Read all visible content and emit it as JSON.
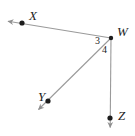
{
  "figure": {
    "type": "geometry-diagram",
    "width": 135,
    "height": 136,
    "background_color": "#ffffff",
    "line_color": "#9a9a9a",
    "point_color": "#1d1d1d",
    "text_color": "#1d1d1d"
  },
  "points": [
    {
      "id": "X",
      "label": "X",
      "x": 22,
      "y": 23
    },
    {
      "id": "W",
      "label": "W",
      "x": 111,
      "y": 38
    },
    {
      "id": "Y",
      "label": "Y",
      "x": 48,
      "y": 101
    },
    {
      "id": "Z",
      "label": "Z",
      "x": 110,
      "y": 118
    }
  ],
  "rays": [
    {
      "id": "WX",
      "from": "W",
      "through": "X",
      "arrow_tip_x": 4,
      "arrow_tip_y": 21
    },
    {
      "id": "WY",
      "from": "W",
      "through": "Y",
      "arrow_tip_x": 35,
      "arrow_tip_y": 113
    },
    {
      "id": "WZ",
      "from": "W",
      "through": "Z",
      "arrow_tip_x": 110,
      "arrow_tip_y": 131
    }
  ],
  "angles": [
    {
      "id": "angle-3",
      "label": "3",
      "between": "WX and WY",
      "x": 98,
      "y": 41
    },
    {
      "id": "angle-4",
      "label": "4",
      "between": "WY and WZ",
      "x": 105,
      "y": 50
    }
  ]
}
